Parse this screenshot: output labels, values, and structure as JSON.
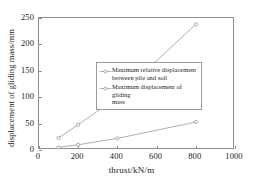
{
  "chart_data": {
    "type": "line",
    "title": "",
    "xlabel": "thrust/kN/m",
    "ylabel": "displacement of gliding mass/mm",
    "xlim": [
      0,
      1000
    ],
    "ylim": [
      0,
      250
    ],
    "xticks": [
      0,
      200,
      400,
      600,
      800,
      1000
    ],
    "yticks": [
      0,
      50,
      100,
      150,
      200,
      250
    ],
    "xtick_labels": [
      "0",
      "200",
      "400",
      "600",
      "800",
      "1000"
    ],
    "ytick_labels": [
      "0",
      "50",
      "100",
      "150",
      "200",
      "250"
    ],
    "grid": false,
    "legend_position": "center-right inside axes",
    "x": [
      100,
      200,
      400,
      800
    ],
    "series": [
      {
        "name": "Maximum relative displacement between pile and soil",
        "name_line1": "Maximum relative displacement",
        "name_line2": "between pile and soil",
        "values": [
          23,
          48,
          100,
          238
        ],
        "marker": "circle",
        "color": "#9a9a9a"
      },
      {
        "name": "Maximum displacement of gliding mass",
        "name_line1": "Maximum displacement of gliding",
        "name_line2": "mass",
        "values": [
          5,
          10,
          22,
          53
        ],
        "marker": "circle",
        "color": "#9a9a9a"
      }
    ]
  },
  "figure": {
    "background": "#ffffff",
    "axis_color": "#8e8e8e",
    "text_color": "#1a1a1a"
  }
}
